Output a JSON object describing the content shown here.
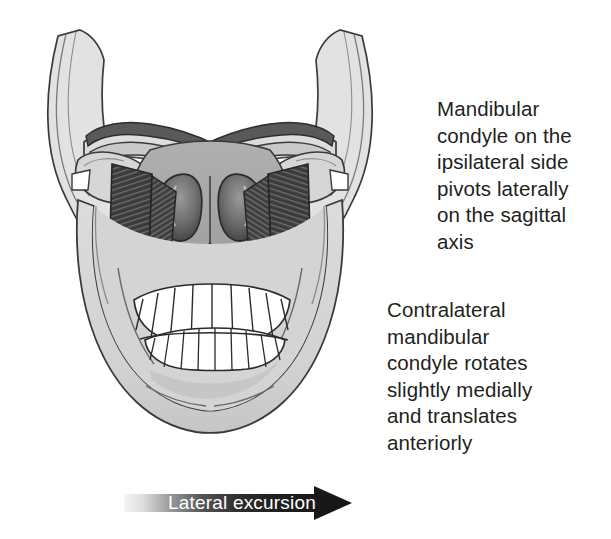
{
  "figure": {
    "illustration_alt": "Grayscale anatomical drawing of a human skull seen from the front, showing the mandible, maxilla, nasal cavity, upper and lower teeth, the zygomatic arches, and the lateral pterygoid muscles on both sides of the temporomandibular joint during a lateral excursion movement."
  },
  "annotations": [
    {
      "id": "ipsilateral-note",
      "text": "Mandibular\ncondyle on the\nipsilateral side\npivots laterally\non the sagittal\naxis"
    },
    {
      "id": "contralateral-note",
      "text": "Contralateral\nmandibular\ncondyle rotates\nslightly medially\nand translates\nanteriorly"
    }
  ],
  "arrow": {
    "label": "Lateral excursion",
    "direction": "right",
    "gradient_from": "#f2f2f2",
    "gradient_to": "#1a1a1a",
    "label_color": "#ffffff"
  },
  "colors": {
    "background": "#ffffff",
    "text": "#231f20",
    "bone_light": "#d9d9d9",
    "bone_mid": "#a8a8a8",
    "bone_dark": "#8a8a8a",
    "cavity_dark": "#4a4a4a",
    "muscle_dark": "#3b3b3b",
    "muscle_stripe": "#6a6a6a",
    "teeth": "#ffffff",
    "outline": "#2b2b2b"
  },
  "anatomy_labels": {
    "mandible": "mandible",
    "maxilla": "maxilla",
    "nasal_cavity": "nasal cavity",
    "upper_teeth": "upper teeth",
    "lower_teeth": "lower teeth",
    "zygomatic_arch_left": "left zygomatic arch",
    "zygomatic_arch_right": "right zygomatic arch",
    "lateral_pterygoid_left": "left lateral pterygoid muscle",
    "lateral_pterygoid_right": "right lateral pterygoid muscle",
    "condyle_left": "left mandibular condyle",
    "condyle_right": "right mandibular condyle"
  }
}
